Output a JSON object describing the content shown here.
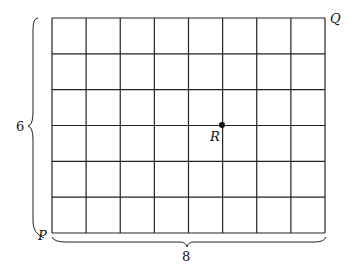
{
  "grid": {
    "columns": 8,
    "rows": 6,
    "x0": 52,
    "y0": 18,
    "x1": 325,
    "y1": 233
  },
  "labels": {
    "P": "P",
    "Q": "Q",
    "R": "R",
    "height": "6",
    "width": "8"
  },
  "point_R": {
    "col": 5,
    "row_from_bottom": 3
  }
}
